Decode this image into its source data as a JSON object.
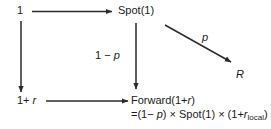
{
  "diagram": {
    "type": "flow-diagram",
    "background_color": "#ffffff",
    "line_color": "#2b2b2b",
    "text_color": "#1a1a1a",
    "nodes": [
      {
        "id": "start",
        "label": "1",
        "x": 17,
        "y": 4
      },
      {
        "id": "spot",
        "label": "Spot(1)",
        "x": 118,
        "y": 4
      },
      {
        "id": "rate",
        "label": "1+ r",
        "x": 17,
        "y": 94
      },
      {
        "id": "r",
        "label": "R",
        "x": 236,
        "y": 68
      },
      {
        "id": "forward",
        "label": "Forward(1+r)",
        "x": 131,
        "y": 94
      }
    ],
    "node_text": {
      "start": "1",
      "spot": "Spot(1)",
      "rate_prefix": "1+ ",
      "rate_var": "r",
      "r_node": "R",
      "forward_prefix": "Forward(1+",
      "forward_var": "r",
      "forward_suffix": ")",
      "formula_open": "=(1− ",
      "formula_p": "p",
      "formula_mid": ") × Spot(1) × (1+",
      "formula_rvar": "r",
      "formula_sub": "local",
      "formula_close": ")"
    },
    "edge_labels": {
      "one_minus_p_prefix": "1 − ",
      "one_minus_p_var": "p",
      "p": "p"
    },
    "edges": [
      {
        "id": "start-to-spot",
        "from": "start",
        "to": "spot",
        "label": "",
        "orientation": "horizontal"
      },
      {
        "id": "start-to-rate",
        "from": "start",
        "to": "rate",
        "label": "",
        "orientation": "vertical"
      },
      {
        "id": "spot-to-forward",
        "from": "spot",
        "to": "forward",
        "label": "1 − p",
        "orientation": "vertical"
      },
      {
        "id": "spot-to-r",
        "from": "spot",
        "to": "r",
        "label": "p",
        "orientation": "diagonal"
      },
      {
        "id": "rate-to-forward",
        "from": "rate",
        "to": "forward",
        "label": "",
        "orientation": "horizontal"
      }
    ]
  }
}
